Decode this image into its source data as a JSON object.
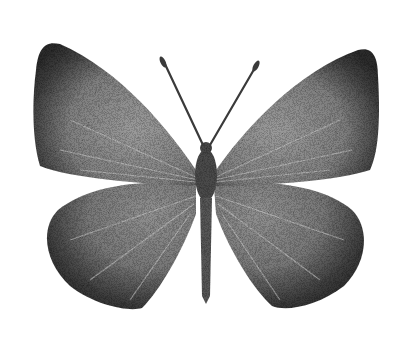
{
  "image": {
    "subject": "butterfly illustration",
    "style": "stippled monochrome engraving",
    "view": "dorsal",
    "background_color": "#ffffff",
    "ink_dark": "#2a2a2a",
    "ink_mid": "#6e6e6e",
    "ink_light": "#b8b8b8"
  }
}
